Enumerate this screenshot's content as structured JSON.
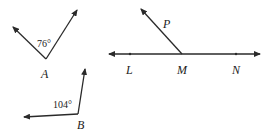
{
  "figure": {
    "angle_a": {
      "vertex_label": "A",
      "measure_label": "76°",
      "measure_deg": 76
    },
    "angle_b": {
      "vertex_label": "B",
      "measure_label": "104°",
      "measure_deg": 104
    },
    "line_lmn": {
      "points": [
        "L",
        "M",
        "N"
      ],
      "ray_label": "P",
      "vertex": "M"
    }
  }
}
